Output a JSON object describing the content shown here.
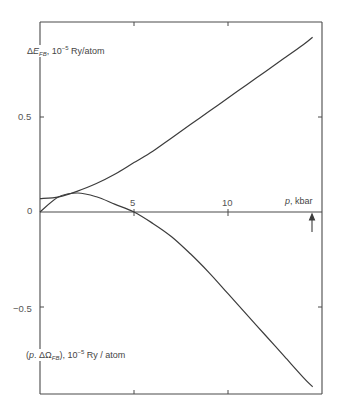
{
  "chart_data": {
    "type": "line",
    "title": "",
    "xlabel": "p, kbar",
    "ylabel_upper": "ΔE_FB, 10^-5 Ry/atom",
    "ylabel_lower": "(p.ΔΩ_FB), 10^-5 Ry / atom",
    "xlim": [
      0,
      15
    ],
    "ylim": [
      -1.0,
      1.0
    ],
    "x_ticks": [
      0,
      5,
      10
    ],
    "x_tick_labels": [
      "0",
      "5",
      "10"
    ],
    "y_ticks": [
      -0.5,
      0,
      0.5
    ],
    "y_tick_labels": [
      "-0.5",
      "0",
      "0.5"
    ],
    "grid": false,
    "legend": "none",
    "annotations": [
      {
        "type": "arrow",
        "x": 14.5,
        "direction": "up",
        "note": "marker below p-axis near right edge"
      }
    ],
    "series": [
      {
        "name": "ΔE_FB",
        "x": [
          0,
          1,
          2,
          3,
          4,
          5,
          6,
          7,
          8,
          9,
          10,
          11,
          12,
          13,
          14,
          14.5
        ],
        "values": [
          0.07,
          0.08,
          0.11,
          0.15,
          0.2,
          0.26,
          0.32,
          0.39,
          0.46,
          0.53,
          0.6,
          0.67,
          0.74,
          0.81,
          0.88,
          0.92
        ]
      },
      {
        "name": "p.ΔΩ_FB",
        "x": [
          0,
          1,
          2,
          3,
          4,
          5,
          6,
          7,
          8,
          9,
          10,
          11,
          12,
          13,
          14,
          14.5
        ],
        "values": [
          0.0,
          0.08,
          0.1,
          0.08,
          0.04,
          0.0,
          -0.06,
          -0.13,
          -0.22,
          -0.32,
          -0.43,
          -0.54,
          -0.65,
          -0.76,
          -0.87,
          -0.92
        ]
      }
    ]
  },
  "labels": {
    "upper_delta": "Δ",
    "upper_E": "E",
    "upper_sub": "FB",
    "upper_unit_pre": ", 10",
    "upper_exp": "−5",
    "upper_unit_post": " Ry/atom",
    "lower_open": "(",
    "lower_p": "p",
    "lower_mid": ". ΔΩ",
    "lower_sub": "FB",
    "lower_close": "), 10",
    "lower_exp": "−5",
    "lower_unit_post": " Ry / atom",
    "x_p": "p",
    "x_unit": ", kbar",
    "tick_0": "0",
    "tick_5": "5",
    "tick_10": "10",
    "tick_05": "0.5",
    "tick_m05": "−0.5"
  },
  "colors": {
    "line": "#3c3c3c",
    "axis": "#4a4a4a"
  }
}
